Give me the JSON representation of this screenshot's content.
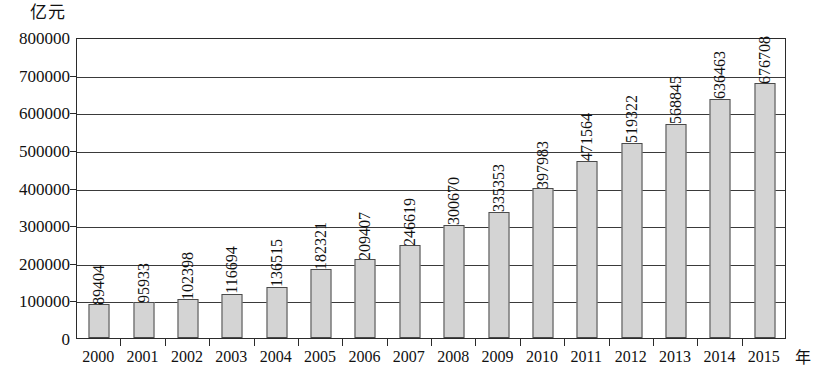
{
  "chart_data": {
    "type": "bar",
    "title": "",
    "xlabel": "年",
    "ylabel": "亿元",
    "ylim": [
      0,
      800000
    ],
    "ytick_step": 100000,
    "grid": true,
    "legend": "none",
    "bar_color": "#d4d4d4",
    "bar_border_color": "#4a4a4a",
    "axis_color": "#2b2b2b",
    "value_labels_rotated": true,
    "categories": [
      "2000",
      "2001",
      "2002",
      "2003",
      "2004",
      "2005",
      "2006",
      "2007",
      "2008",
      "2009",
      "2010",
      "2011",
      "2012",
      "2013",
      "2014",
      "2015"
    ],
    "values": [
      89404,
      95933,
      102398,
      116694,
      136515,
      182321,
      209407,
      246619,
      300670,
      335353,
      397983,
      471564,
      519322,
      568845,
      636463,
      676708
    ],
    "value_labels": [
      "89404",
      "95933",
      "102398",
      "116694",
      "136515",
      "182321",
      "209407",
      "246619",
      "300670",
      "335353",
      "397983",
      "471564",
      "519322",
      "568845",
      "636463",
      "676708"
    ],
    "yticks": [
      0,
      100000,
      200000,
      300000,
      400000,
      500000,
      600000,
      700000,
      800000
    ],
    "ytick_labels": [
      "0",
      "100000",
      "200000",
      "300000",
      "400000",
      "500000",
      "600000",
      "700000",
      "800000"
    ]
  }
}
